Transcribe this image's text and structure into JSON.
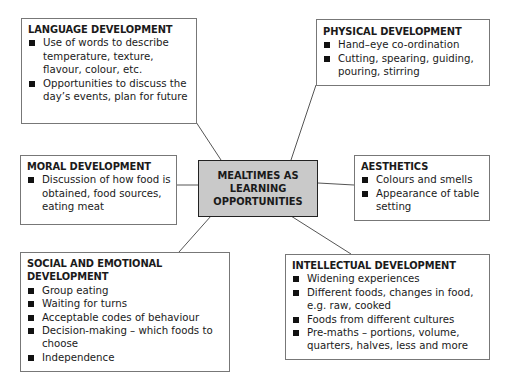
{
  "center": {
    "label": "MEALTIMES AS LEARNING OPPORTUNITIES",
    "lines": [
      "MEALTIMES AS",
      "LEARNING",
      "OPPORTUNITIES"
    ],
    "fill": "#c9c9c9"
  },
  "nodes": {
    "language": {
      "title": "LANGUAGE DEVELOPMENT",
      "items": [
        "Use of words to describe temperature, texture, flavour, colour, etc.",
        "Opportunities to discuss the day’s events, plan for future"
      ]
    },
    "physical": {
      "title": "PHYSICAL DEVELOPMENT",
      "items": [
        "Hand–eye co-ordination",
        "Cutting, spearing, guiding, pouring, stirring"
      ]
    },
    "moral": {
      "title": "MORAL DEVELOPMENT",
      "items": [
        "Discussion of how food is obtained, food sources, eating meat"
      ]
    },
    "aesthetics": {
      "title": "AESTHETICS",
      "items": [
        "Colours and smells",
        "Appearance of table setting"
      ]
    },
    "social": {
      "title": "SOCIAL AND EMOTIONAL DEVELOPMENT",
      "items": [
        "Group eating",
        "Waiting for turns",
        "Acceptable codes of behaviour",
        "Decision-making – which foods to choose",
        "Independence"
      ]
    },
    "intellectual": {
      "title": "INTELLECTUAL DEVELOPMENT",
      "items": [
        "Widening experiences",
        "Different foods, changes in food, e.g. raw, cooked",
        "Foods from different cultures",
        "Pre-maths – portions, volume, quarters, halves, less and more"
      ]
    }
  }
}
